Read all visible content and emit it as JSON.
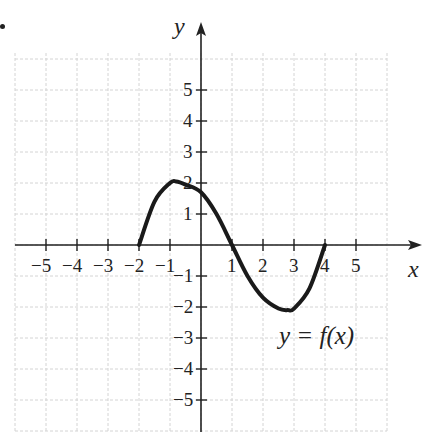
{
  "chart_data": {
    "type": "line",
    "title": "",
    "xlabel": "x",
    "ylabel": "y",
    "xlim": [
      -6,
      6.5
    ],
    "ylim": [
      -6,
      6.5
    ],
    "grid": true,
    "x_ticks": [
      -5,
      -4,
      -3,
      -2,
      -1,
      1,
      2,
      3,
      4,
      5
    ],
    "y_ticks": [
      5,
      4,
      3,
      2,
      1,
      -1,
      -2,
      -3,
      -4,
      -5
    ],
    "x_tick_labels": [
      "−5",
      "−4",
      "−3",
      "−2",
      "−1",
      "1",
      "2",
      "3",
      "4",
      "5"
    ],
    "y_tick_labels": [
      "5",
      "4",
      "3",
      "2",
      "1",
      "−1",
      "−2",
      "−3",
      "−4",
      "−5"
    ],
    "series": [
      {
        "name": "y = f(x)",
        "x": [
          -2,
          -1.5,
          -1,
          -0.8,
          -0.5,
          0,
          0.5,
          1,
          1.5,
          2,
          2.5,
          2.8,
          3,
          3.5,
          4
        ],
        "y": [
          0,
          1.4,
          2.0,
          2.05,
          1.95,
          1.7,
          1.0,
          0,
          -1.0,
          -1.7,
          -2.05,
          -2.1,
          -2.05,
          -1.4,
          0
        ]
      }
    ],
    "annotations": [
      {
        "text": "y = f(x)",
        "x": 3.6,
        "y": -2.8
      }
    ],
    "domain_endpoints": [
      [
        -2,
        0
      ],
      [
        4,
        0
      ]
    ],
    "local_max": [
      -0.8,
      2.05
    ],
    "local_min": [
      2.8,
      -2.1
    ]
  },
  "labels": {
    "x_axis": "x",
    "y_axis": "y",
    "curve": "y = f(x)"
  }
}
